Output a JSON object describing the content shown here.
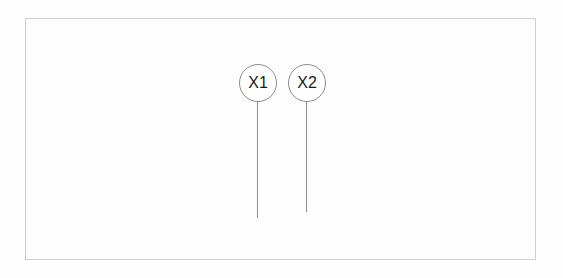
{
  "diagram": {
    "title": "",
    "background_color": "#fefefe",
    "frame": {
      "name": "drawing-border",
      "stroke_color": "#cfcfcf",
      "fill_color": "#fdfdfd",
      "x": 25,
      "y": 18,
      "width": 511,
      "height": 242
    },
    "callouts": [
      {
        "label": "X1",
        "circle": {
          "cx": 258,
          "cy": 83,
          "r": 19,
          "stroke_color": "#8c8c8c",
          "fill_color": "#ffffff"
        },
        "leader_line": {
          "x": 257,
          "y_start": 102,
          "y_end": 218,
          "stroke_color": "#8c8c8c"
        },
        "text_color": "#1a1a1a"
      },
      {
        "label": "X2",
        "circle": {
          "cx": 307,
          "cy": 83,
          "r": 19,
          "stroke_color": "#8c8c8c",
          "fill_color": "#ffffff"
        },
        "leader_line": {
          "x": 306,
          "y_start": 102,
          "y_end": 212,
          "stroke_color": "#8c8c8c"
        },
        "text_color": "#1a1a1a"
      }
    ]
  }
}
